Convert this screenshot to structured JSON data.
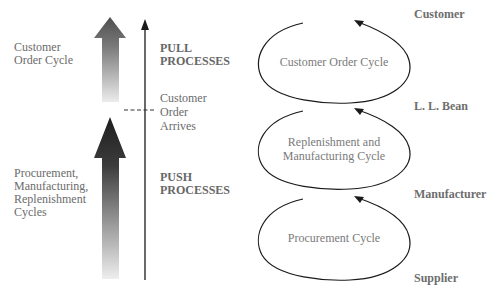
{
  "left_labels": {
    "pull_cycle": [
      "Customer",
      "Order Cycle"
    ],
    "push_cycles": [
      "Procurement,",
      "Manufacturing,",
      "Replenishment",
      "Cycles"
    ]
  },
  "middle_labels": {
    "pull": [
      "PULL",
      "PROCESSES"
    ],
    "boundary": [
      "Customer",
      "Order",
      "Arrives"
    ],
    "push": [
      "PUSH",
      "PROCESSES"
    ]
  },
  "cycles": [
    {
      "label": [
        "Customer Order Cycle"
      ]
    },
    {
      "label": [
        "Replenishment and",
        "Manufacturing Cycle"
      ]
    },
    {
      "label": [
        "Procurement Cycle"
      ]
    }
  ],
  "tiers": [
    "Customer",
    "L. L. Bean",
    "Manufacturer",
    "Supplier"
  ],
  "colors": {
    "line": "#1a1a1a",
    "pull_arrow_top": "#555555",
    "push_arrow_top": "#222222",
    "text": "#6b6b6b"
  }
}
